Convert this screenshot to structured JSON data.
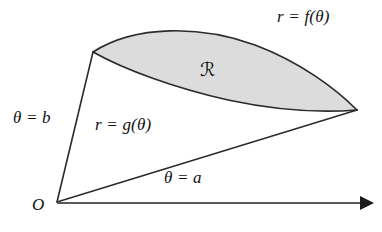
{
  "figure": {
    "background_color": "#ffffff",
    "stroke_color": "#2b2b2b",
    "region_fill_color": "#dcdcdc",
    "labels": {
      "outer_curve": "r = f(θ)",
      "inner_curve": "r = g(θ)",
      "upper_ray": "θ = b",
      "lower_ray": "θ = a",
      "origin": "O",
      "region": "ℛ"
    },
    "geometry": {
      "origin_point": [
        57,
        202
      ],
      "left_vertex": [
        93,
        52
      ],
      "right_vertex": [
        357,
        110
      ],
      "axis_start": [
        57,
        203
      ],
      "axis_end": [
        372,
        203
      ],
      "axis_arrowhead": "solid-triangle"
    }
  }
}
